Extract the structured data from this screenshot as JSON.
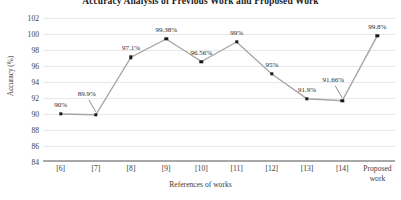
{
  "chart_data": {
    "type": "line",
    "title": "Accuracy Analysis of Previous Work and Proposed Work",
    "xlabel": "References of works",
    "ylabel": "Accuracy (%)",
    "categories": [
      "[6]",
      "[7]",
      "[8]",
      "[9]",
      "[10]",
      "[11]",
      "[12]",
      "[13]",
      "[14]",
      "Proposed work"
    ],
    "values": [
      90,
      89.9,
      97.1,
      99.38,
      96.56,
      99,
      95,
      91.9,
      91.66,
      99.8
    ],
    "point_labels": [
      "90%",
      "89.9%",
      "97.1%",
      "99.38%",
      "96.56%",
      "99%",
      "95%",
      "91.9%",
      "91.66%",
      "99.8%"
    ],
    "ylim": [
      84,
      102
    ],
    "ytick_labels": [
      "102",
      "100",
      "98",
      "96",
      "94",
      "92",
      "90",
      "88",
      "86",
      "84"
    ],
    "ytick_values": [
      102,
      100,
      98,
      96,
      94,
      92,
      90,
      88,
      86,
      84
    ],
    "grid": true,
    "legend": "none",
    "line_color": "#a6a6a6",
    "marker_color": "#1a1a1a",
    "gridline_color": "#e8e8e8",
    "axis_color": "#a8a8a8",
    "leader_line_points": [
      "[7]",
      "[14]"
    ]
  }
}
